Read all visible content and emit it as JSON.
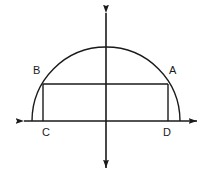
{
  "figure": {
    "name": "semicircle-with-inscribed-rectangle",
    "background_color": "#ffffff",
    "stroke_color": "#1a1a1a",
    "label_color": "#1a1a1a",
    "canvas": {
      "width": 218,
      "height": 183
    }
  },
  "axes": {
    "origin": {
      "x": 106,
      "y": 121
    },
    "x_axis": {
      "name": "horizontal-axis",
      "from": {
        "x": 16,
        "y": 121
      },
      "to": {
        "x": 205,
        "y": 121
      },
      "arrows": "both"
    },
    "y_axis": {
      "name": "vertical-axis",
      "from": {
        "x": 106,
        "y": 5
      },
      "to": {
        "x": 106,
        "y": 176
      },
      "arrows": "both"
    }
  },
  "semicircle": {
    "center": {
      "x": 106,
      "y": 121
    },
    "radius": 74,
    "left_endpoint": {
      "x": 32,
      "y": 121
    },
    "right_endpoint": {
      "x": 180,
      "y": 121
    },
    "apex": {
      "x": 106,
      "y": 47
    }
  },
  "rectangle": {
    "left": 43,
    "right": 168,
    "top": 84,
    "bottom": 121,
    "width": 125,
    "height": 37
  },
  "labels": [
    {
      "id": "B",
      "text": "B",
      "x": 33,
      "y": 65,
      "vertex": {
        "x": 43,
        "y": 84
      },
      "description": "upper-left vertex on semicircle"
    },
    {
      "id": "A",
      "text": "A",
      "x": 169,
      "y": 65,
      "vertex": {
        "x": 168,
        "y": 84
      },
      "description": "upper-right vertex on semicircle"
    },
    {
      "id": "C",
      "text": "C",
      "x": 42,
      "y": 127,
      "vertex": {
        "x": 43,
        "y": 121
      },
      "description": "lower-left vertex on x-axis"
    },
    {
      "id": "D",
      "text": "D",
      "x": 163,
      "y": 127,
      "vertex": {
        "x": 168,
        "y": 121
      },
      "description": "lower-right vertex on x-axis"
    }
  ]
}
